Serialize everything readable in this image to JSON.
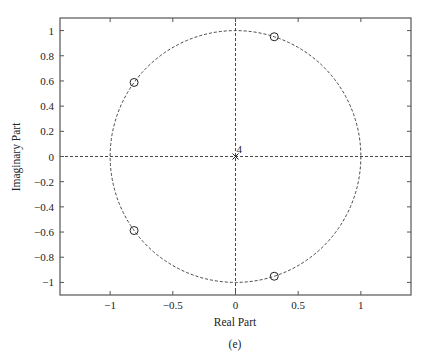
{
  "chart_data": {
    "type": "scatter",
    "title": "",
    "subtitle": "",
    "caption": "(e)",
    "xlabel": "Real Part",
    "ylabel": "Imaginary Part",
    "xlim": [
      -1.4,
      1.4
    ],
    "ylim": [
      -1.1,
      1.1
    ],
    "grid": false,
    "legend": null,
    "x_ticks": [
      -1,
      -0.5,
      0,
      0.5,
      1
    ],
    "x_tick_labels": [
      "−1",
      "−0.5",
      "0",
      "0.5",
      "1"
    ],
    "y_ticks": [
      1,
      0.8,
      0.6,
      0.4,
      0.2,
      0,
      -0.2,
      -0.4,
      -0.6,
      -0.8,
      -1
    ],
    "y_tick_labels": [
      "1",
      "0.8",
      "0.6",
      "0.4",
      "0.2",
      "0",
      "−0.2",
      "−0.4",
      "−0.6",
      "−0.8",
      "−1"
    ],
    "unit_circle": {
      "center": [
        0,
        0
      ],
      "radius": 1,
      "style": "dashed"
    },
    "reference_lines": [
      {
        "axis": "x",
        "value": 0,
        "style": "dashed"
      },
      {
        "axis": "y",
        "value": 0,
        "style": "dashed"
      }
    ],
    "series": [
      {
        "name": "zeros",
        "marker": "circle",
        "points": [
          [
            0.309,
            0.951
          ],
          [
            -0.809,
            0.588
          ],
          [
            -0.809,
            -0.588
          ],
          [
            0.309,
            -0.951
          ]
        ]
      },
      {
        "name": "poles",
        "marker": "x",
        "points": [
          [
            0,
            0
          ]
        ],
        "multiplicity_label": "4"
      }
    ]
  }
}
